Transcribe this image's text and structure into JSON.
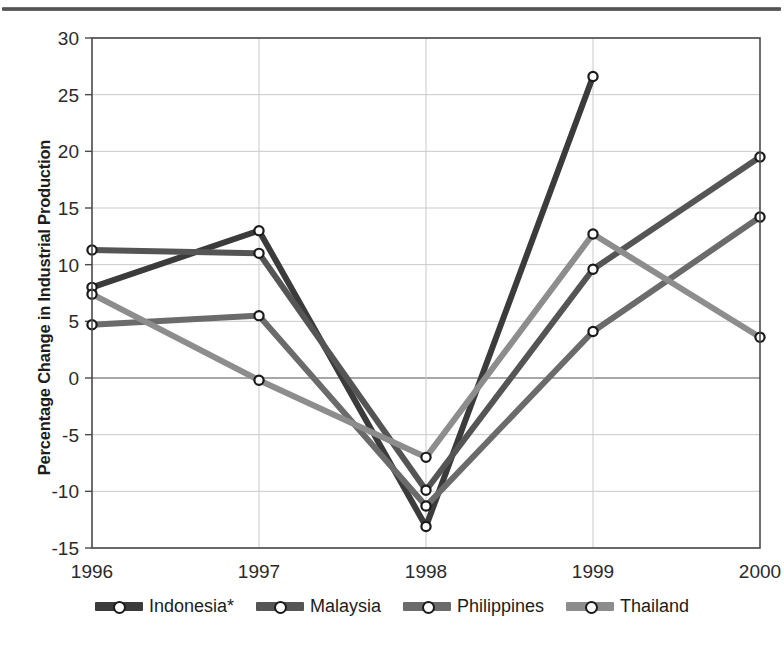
{
  "figure": {
    "background_color": "#ffffff",
    "has_top_rule": true
  },
  "chart_data": {
    "type": "line",
    "title": "",
    "xlabel": "",
    "ylabel": "Percentage Change in Industrial Production",
    "categories": [
      "1996",
      "1997",
      "1998",
      "1999",
      "2000"
    ],
    "x_tick_labels": [
      "1996",
      "1997",
      "1998",
      "1999",
      "2000"
    ],
    "y_tick_labels": [
      "30",
      "25",
      "20",
      "15",
      "10",
      "5",
      "0",
      "-5",
      "-10",
      "-15"
    ],
    "y_ticks": [
      30,
      25,
      20,
      15,
      10,
      5,
      0,
      -5,
      -10,
      -15
    ],
    "ylim": [
      -15,
      30
    ],
    "grid": true,
    "legend_position": "bottom",
    "marker": "open-circle",
    "series": [
      {
        "name": "Indonesia*",
        "color": "#3b3b3b",
        "values": [
          8.0,
          13.0,
          -13.1,
          26.6,
          null
        ]
      },
      {
        "name": "Malaysia",
        "color": "#555555",
        "values": [
          11.3,
          11.0,
          -9.9,
          9.6,
          19.5
        ]
      },
      {
        "name": "Philippines",
        "color": "#6b6b6b",
        "values": [
          4.7,
          5.5,
          -11.3,
          4.1,
          14.2
        ]
      },
      {
        "name": "Thailand",
        "color": "#8d8d8d",
        "values": [
          7.4,
          -0.2,
          -7.0,
          12.7,
          3.6
        ]
      }
    ]
  },
  "legend": {
    "items": [
      {
        "label": "Indonesia*",
        "color": "#3b3b3b"
      },
      {
        "label": "Malaysia",
        "color": "#555555"
      },
      {
        "label": "Philippines",
        "color": "#6b6b6b"
      },
      {
        "label": "Thailand",
        "color": "#8d8d8d"
      }
    ]
  },
  "footnote": {
    "text": ""
  }
}
